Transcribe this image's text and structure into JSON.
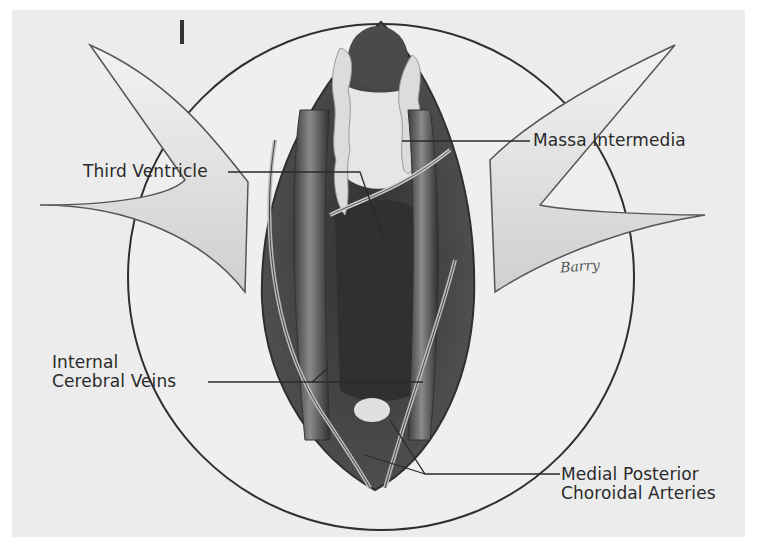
{
  "figure": {
    "number": "I",
    "signature": "Barry"
  },
  "labels": [
    {
      "id": "third-ventricle",
      "lines": [
        "Third Ventricle"
      ],
      "x": 83,
      "y": 162
    },
    {
      "id": "massa-intermedia",
      "lines": [
        "Massa Intermedia"
      ],
      "x": 533,
      "y": 131
    },
    {
      "id": "internal-cerebral-veins",
      "lines": [
        "Internal",
        "Cerebral Veins"
      ],
      "x": 52,
      "y": 343
    },
    {
      "id": "medial-posterior-choroidal-arteries",
      "lines": [
        "Medial Posterior",
        "Choroidal Arteries"
      ],
      "x": 561,
      "y": 466
    }
  ],
  "colors": {
    "background": "#ececec",
    "outline": "#2f2f2f",
    "cavity_dark": "#3a3a3a",
    "vein": "#6a6a6a",
    "plexus": "#d9d9d9",
    "tissue": "#f2f2f2"
  }
}
